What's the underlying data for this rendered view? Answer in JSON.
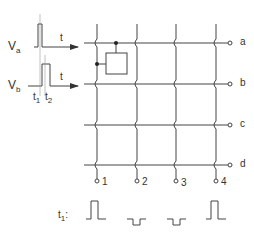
{
  "signals": {
    "va": {
      "main": "V",
      "sub": "a"
    },
    "vb": {
      "main": "V",
      "sub": "b"
    },
    "time_axis": "t",
    "t1": {
      "main": "t",
      "sub": "1"
    },
    "t2": {
      "main": "t",
      "sub": "2"
    }
  },
  "rows": [
    "a",
    "b",
    "c",
    "d"
  ],
  "columns": [
    "1",
    "2",
    "3",
    "4"
  ],
  "pulse_label": {
    "main": "t",
    "sub": "1",
    "suffix": ":"
  },
  "column_pulses": [
    "positive",
    "negative",
    "negative",
    "positive"
  ],
  "colors": {
    "line": "#444444",
    "text": "#333333"
  }
}
